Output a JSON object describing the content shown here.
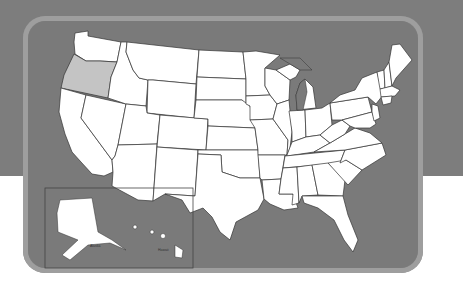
{
  "map": {
    "title": "United States",
    "highlighted_state": "Oregon",
    "colors": {
      "background_band": "#7d7d7d",
      "panel_border": "#9e9e9e",
      "panel_fill": "#7a7a7a",
      "state_fill": "#ffffff",
      "highlight_fill": "#c4c4c4",
      "state_stroke": "#333333",
      "lakes": "#7a7a7a"
    },
    "inset": {
      "labels": [
        "Alaska",
        "Hawaii"
      ]
    }
  }
}
